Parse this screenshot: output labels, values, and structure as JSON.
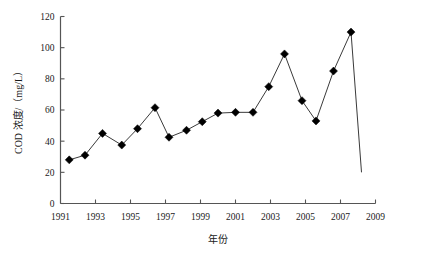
{
  "chart_data": {
    "type": "line",
    "title": "",
    "xlabel": "年份",
    "ylabel": "COD 浓度/（mg/L）",
    "xlim": [
      1991,
      2009
    ],
    "ylim": [
      0,
      120
    ],
    "grid": false,
    "legend": null,
    "marker": "diamond",
    "line_color": "#333333",
    "marker_color": "#000000",
    "x_tick_labels": [
      "1991",
      "1993",
      "1995",
      "1997",
      "1999",
      "2001",
      "2003",
      "2005",
      "2007",
      "2009"
    ],
    "x_tick_values": [
      1991,
      1993,
      1995,
      1997,
      1999,
      2001,
      2003,
      2005,
      2007,
      2009
    ],
    "y_tick_labels": [
      "0",
      "20",
      "40",
      "60",
      "80",
      "100",
      "120"
    ],
    "y_tick_values": [
      0,
      20,
      40,
      60,
      80,
      100,
      120
    ],
    "x": [
      1991.5,
      1992.4,
      1993.4,
      1994.5,
      1995.4,
      1996.4,
      1997.2,
      1998.2,
      1999.1,
      2000.0,
      2001.0,
      2002.0,
      2002.9,
      2003.8,
      2004.8,
      2005.6,
      2006.6,
      2007.6
    ],
    "values": [
      28,
      31,
      45,
      37.5,
      48,
      61.5,
      42.5,
      47,
      52.5,
      58,
      58.5,
      58.5,
      75,
      96,
      66,
      53,
      85,
      110
    ],
    "trailing_segment": {
      "x": 2008.2,
      "y": 20,
      "has_marker": false
    }
  },
  "axis": {
    "y_axis_label": "COD 浓度/（mg/L）",
    "x_axis_label": "年份"
  }
}
